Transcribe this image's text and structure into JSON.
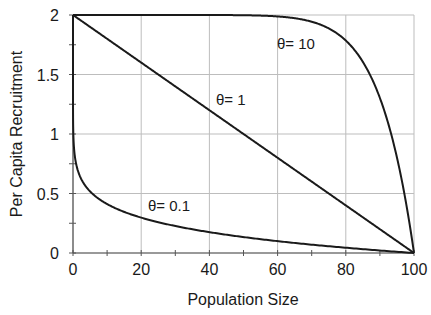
{
  "chart_data": {
    "type": "line",
    "title": "",
    "xlabel": "Population Size",
    "ylabel": "Per Capita Recruitment",
    "xlim": [
      0,
      100
    ],
    "ylim": [
      0,
      2
    ],
    "xticks": [
      0,
      20,
      40,
      60,
      80,
      100
    ],
    "xtick_labels": [
      "0",
      "20",
      "40",
      "60",
      "80",
      "100"
    ],
    "yticks": [
      0,
      0.5,
      1,
      1.5,
      2
    ],
    "ytick_labels": [
      "0",
      "0.5",
      "1",
      "1.5",
      "2"
    ],
    "grid": true,
    "legend": "none (inline labels)",
    "model": "r(N) = 2 * (1 - (N/100)^theta)",
    "series": [
      {
        "name": "θ= 0.1",
        "theta": 0.1,
        "x": [
          0,
          1,
          2,
          5,
          10,
          20,
          30,
          40,
          50,
          60,
          70,
          80,
          90,
          100
        ],
        "values": [
          2.0,
          0.738,
          0.64,
          0.518,
          0.411,
          0.298,
          0.228,
          0.176,
          0.134,
          0.1,
          0.07,
          0.044,
          0.021,
          0.0
        ]
      },
      {
        "name": "θ= 1",
        "theta": 1,
        "x": [
          0,
          20,
          40,
          60,
          80,
          100
        ],
        "values": [
          2.0,
          1.6,
          1.2,
          0.8,
          0.4,
          0.0
        ]
      },
      {
        "name": "θ= 10",
        "theta": 10,
        "x": [
          0,
          40,
          50,
          60,
          70,
          80,
          85,
          90,
          95,
          100
        ],
        "values": [
          2.0,
          2.0,
          1.998,
          1.988,
          1.944,
          1.785,
          1.606,
          1.303,
          0.803,
          0.0
        ]
      }
    ],
    "annotations": [
      {
        "text": "θ= 10",
        "x": 69,
        "y": 1.73
      },
      {
        "text": "θ= 1",
        "x": 45,
        "y": 1.14
      },
      {
        "text": "θ= 0.1",
        "x": 22,
        "y": 0.4
      }
    ]
  },
  "labels": {
    "xlabel": "Population Size",
    "ylabel": "Per Capita Recruitment",
    "theta10": "θ= 10",
    "theta1": "θ= 1",
    "theta01": "θ= 0.1"
  }
}
